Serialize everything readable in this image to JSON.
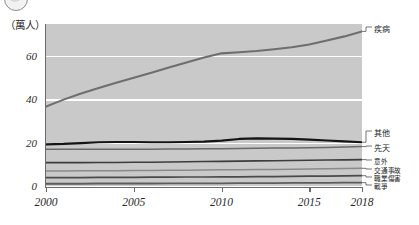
{
  "axis_unit_label": "（萬人）",
  "badge": {
    "icon": "circle-badge-icon"
  },
  "chart_data": {
    "type": "line",
    "title": "",
    "subtitle": "",
    "xlabel": "",
    "ylabel": "（萬人）",
    "unit": "萬人",
    "grid": true,
    "legend_position": "right-leader-lines",
    "plot_background": "#c9c9c9",
    "gridline_color": "#fdfdfd",
    "xlim": [
      2000,
      2018
    ],
    "ylim": [
      0,
      75
    ],
    "yticks": [
      0,
      20,
      40,
      60
    ],
    "ytick_labels": [
      "0",
      "20",
      "40",
      "60"
    ],
    "xticks": [
      2000,
      2005,
      2010,
      2015,
      2018
    ],
    "xtick_labels": [
      "2000",
      "2005",
      "2010",
      "2015",
      "2018"
    ],
    "x": [
      2000,
      2001,
      2002,
      2003,
      2004,
      2005,
      2006,
      2007,
      2008,
      2009,
      2010,
      2011,
      2012,
      2013,
      2014,
      2015,
      2016,
      2017,
      2018
    ],
    "series": [
      {
        "name": "疾病",
        "label": "疾病",
        "color": "#6e6e6e",
        "width": 2.1,
        "values": [
          37.0,
          40.2,
          43.0,
          45.5,
          48.0,
          50.3,
          52.6,
          55.0,
          57.3,
          59.6,
          61.5,
          62.0,
          62.6,
          63.4,
          64.3,
          65.6,
          67.4,
          69.3,
          71.6
        ]
      },
      {
        "name": "其他",
        "label": "其他",
        "color": "#141414",
        "width": 2.2,
        "values": [
          19.6,
          19.8,
          20.2,
          20.6,
          20.7,
          20.7,
          20.6,
          20.6,
          20.7,
          20.9,
          21.3,
          22.1,
          22.4,
          22.3,
          22.1,
          21.8,
          21.4,
          21.0,
          20.6
        ]
      },
      {
        "name": "先天",
        "label": "先天",
        "color": "#6a6a6a",
        "width": 1.5,
        "values": [
          17.4,
          17.4,
          17.4,
          17.4,
          17.4,
          17.4,
          17.4,
          17.5,
          17.5,
          17.6,
          17.6,
          17.7,
          17.8,
          17.9,
          18.0,
          18.1,
          18.2,
          18.4,
          18.6
        ]
      },
      {
        "name": "意外",
        "label": "意外",
        "color": "#3d3d3d",
        "width": 1.6,
        "values": [
          11.2,
          11.2,
          11.2,
          11.3,
          11.3,
          11.4,
          11.4,
          11.5,
          11.6,
          11.7,
          11.8,
          11.9,
          12.0,
          12.1,
          12.2,
          12.3,
          12.4,
          12.5,
          12.6
        ]
      },
      {
        "name": "交通事故",
        "label": "交通事故",
        "color": "#8a8a8a",
        "width": 1.5,
        "values": [
          7.4,
          7.4,
          7.5,
          7.5,
          7.5,
          7.6,
          7.6,
          7.7,
          7.7,
          7.8,
          7.9,
          7.9,
          8.0,
          8.1,
          8.2,
          8.3,
          8.4,
          8.5,
          8.6
        ]
      },
      {
        "name": "職業傷害",
        "label": "職業傷害",
        "color": "#4a4a4a",
        "width": 1.7,
        "values": [
          4.3,
          4.3,
          4.3,
          4.4,
          4.4,
          4.4,
          4.5,
          4.5,
          4.6,
          4.6,
          4.7,
          4.7,
          4.8,
          4.8,
          4.9,
          5.0,
          5.0,
          5.1,
          5.2
        ]
      },
      {
        "name": "戰爭",
        "label": "戰爭",
        "color": "#5c5c5c",
        "width": 1.8,
        "values": [
          1.5,
          1.5,
          1.5,
          1.6,
          1.6,
          1.6,
          1.6,
          1.7,
          1.7,
          1.7,
          1.7,
          1.8,
          1.8,
          1.8,
          1.9,
          1.9,
          1.9,
          2.0,
          2.0
        ]
      }
    ],
    "legend_entries": [
      "疾病",
      "其他",
      "先天",
      "意外",
      "交通事故",
      "職業傷害",
      "戰爭"
    ]
  }
}
